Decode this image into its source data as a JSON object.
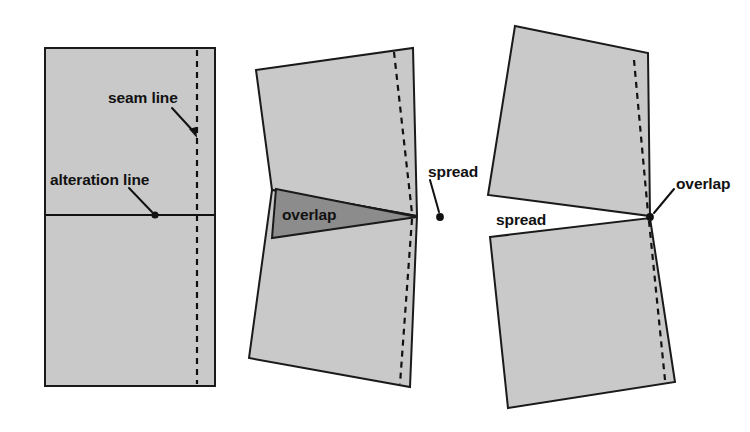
{
  "figure": {
    "width": 750,
    "height": 432,
    "background_color": "#ffffff",
    "panel_fill_color": "#c9c9c9",
    "overlap_fill_color": "#8c8c8c",
    "stroke_color": "#111111"
  },
  "labels": {
    "seam_line": "seam line",
    "alteration_line": "alteration line",
    "overlap_left": "overlap",
    "spread_middle": "spread",
    "spread_right": "spread",
    "overlap_right": "overlap"
  },
  "panels": [
    {
      "name": "undisturbed-pattern",
      "caption_labels": [
        "seam line",
        "alteration line"
      ],
      "description": "Rectangular pattern piece with a vertical dashed seam line near the right edge and a horizontal solid alteration line across the middle."
    },
    {
      "name": "overlapped-pattern",
      "caption_labels": [
        "overlap",
        "spread"
      ],
      "description": "Pattern piece rotated closed about the seam-line pivot, creating a dark wedge of overlap on the left and spread at the seam line on the right."
    },
    {
      "name": "spread-pattern",
      "caption_labels": [
        "spread",
        "overlap"
      ],
      "description": "Pattern piece rotated open about the seam-line pivot, creating a wedge-shaped spread gap on the left and overlap at the seam line on the right."
    }
  ],
  "geometry": {
    "fig1": {
      "outline": "45,48 215,48 215,386 45,386",
      "seam_dash": "197,50 197,384",
      "alteration_line": "46,215 214,215",
      "seam_leader": "172,108 196,134",
      "alteration_leader": "129,188 153,213",
      "seam_dot": {
        "cx": 197,
        "cy": 137,
        "r": 3.4
      },
      "alteration_dot": {
        "cx": 155,
        "cy": 215,
        "r": 3.4
      },
      "seam_label_pos": {
        "x": 108,
        "y": 102
      },
      "alteration_label_pos": {
        "x": 50,
        "y": 184
      }
    },
    "fig2": {
      "upper": "256,70 413,48 417,216 272,190",
      "lower": "272,190 417,216 410,387 249,358",
      "overlap": "276,189 417,217 272,238",
      "seam_dash_upper": "394,52 412,214",
      "seam_dash_lower": "412,218 400,384",
      "spread_leader": "430,176 440,214",
      "spread_dot": {
        "cx": 440,
        "cy": 217,
        "r": 3.8
      },
      "overlap_label_pos": {
        "x": 282,
        "y": 220
      },
      "spread_label_pos": {
        "x": 428,
        "y": 176
      }
    },
    "fig3": {
      "upper": "515,26 648,53 650,216 488,195",
      "lower": "490,237 650,218 675,382 508,408",
      "seam_dash_upper": "634,60 648,215",
      "seam_dash_lower": "648,220 665,380",
      "overlap_leader": "672,190 652,214",
      "overlap_dot": {
        "cx": 650,
        "cy": 217,
        "r": 3.8
      },
      "spread_label_pos": {
        "x": 496,
        "y": 224
      },
      "overlap_label_pos": {
        "x": 676,
        "y": 188
      }
    }
  }
}
